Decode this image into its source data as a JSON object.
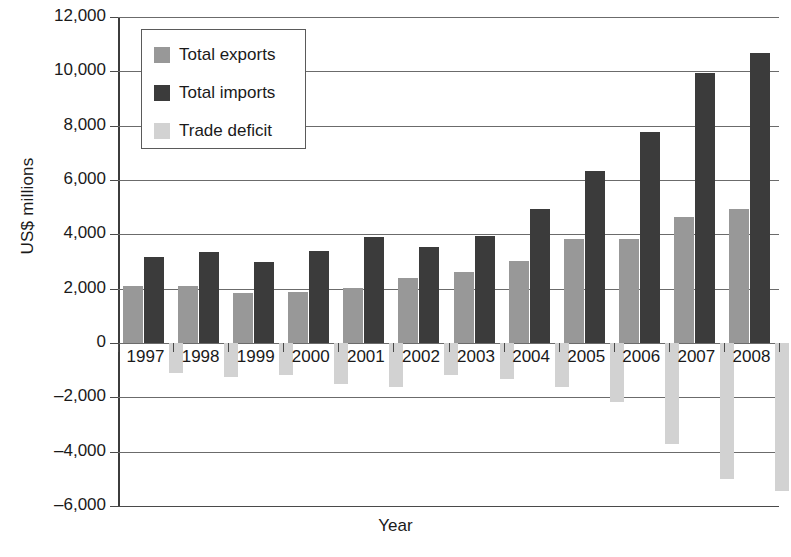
{
  "chart_data": {
    "type": "bar",
    "title": "",
    "xlabel": "Year",
    "ylabel": "US$ millions",
    "categories": [
      "1997",
      "1998",
      "1999",
      "2000",
      "2001",
      "2002",
      "2003",
      "2004",
      "2005",
      "2006",
      "2007",
      "2008"
    ],
    "series": [
      {
        "name": "Total exports",
        "color": "#989898",
        "values": [
          2080,
          2100,
          1830,
          1870,
          2020,
          2380,
          2600,
          3030,
          3830,
          3840,
          4650,
          4950
        ]
      },
      {
        "name": "Total imports",
        "color": "#3b3b3b",
        "values": [
          3170,
          3360,
          3000,
          3380,
          3900,
          3540,
          3930,
          4930,
          6320,
          7750,
          9930,
          10680
        ]
      },
      {
        "name": "Trade deficit",
        "color": "#d2d2d2",
        "values": [
          -1090,
          -1260,
          -1170,
          -1510,
          -1620,
          -1160,
          -1330,
          -1620,
          -2190,
          -3700,
          -5010,
          -5430
        ]
      }
    ],
    "ylim": [
      -6000,
      12000
    ],
    "ytick_values": [
      12000,
      10000,
      8000,
      6000,
      4000,
      2000,
      0,
      -2000,
      -4000,
      -6000
    ],
    "ytick_labels": [
      "12,000",
      "10,000",
      "8,000",
      "6,000",
      "4,000",
      "2,000",
      "0",
      "–2,000",
      "–4,000",
      "–6,000"
    ],
    "grid": true,
    "legend_position": "top-left"
  },
  "legend": {
    "items": [
      {
        "label": "Total exports",
        "swatch": "#989898"
      },
      {
        "label": "Total imports",
        "swatch": "#3b3b3b"
      },
      {
        "label": "Trade deficit",
        "swatch": "#d2d2d2"
      }
    ]
  },
  "axes": {
    "y_title": "US$ millions",
    "x_title": "Year"
  }
}
